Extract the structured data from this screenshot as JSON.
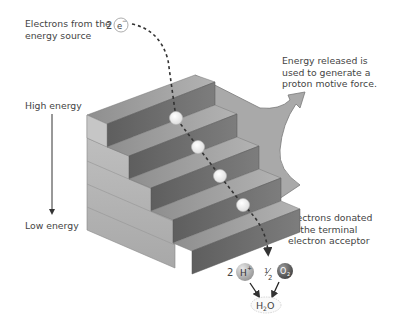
{
  "labels": {
    "electrons_source_line1": "Electrons from the",
    "electrons_source_line2": "energy source",
    "energy_released_line1": "Energy released is",
    "energy_released_line2": "used to generate a",
    "energy_released_line3": "proton motive force.",
    "high_energy": "High energy",
    "low_energy": "Low energy",
    "donated_line1": "Electrons donated",
    "donated_line2": "to the terminal",
    "donated_line3": "electron acceptor"
  },
  "chemistry": {
    "electron_coefficient": "2",
    "electron_symbol": "e",
    "electron_charge": "−",
    "proton_coefficient": "2",
    "proton_symbol": "H",
    "proton_charge": "+",
    "oxygen_coefficient_num": "1",
    "oxygen_coefficient_den": "2",
    "oxygen_symbol": "O",
    "oxygen_subscript": "2",
    "water_h": "H",
    "water_sub": "2",
    "water_o": "O"
  },
  "staircase": {
    "steps": 5,
    "electron_stops": 4
  },
  "colors": {
    "step_top": "#9a9a9a",
    "step_riser": "#6f6f6f",
    "step_side": "#b8b8b8",
    "arrow_fill": "#a8a8a8",
    "text": "#444444"
  }
}
